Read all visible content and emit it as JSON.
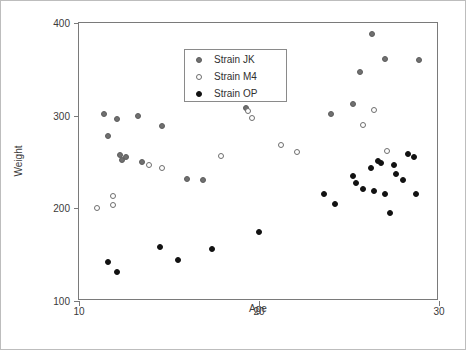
{
  "chart_data": {
    "type": "scatter",
    "title": "",
    "xlabel": "Age",
    "ylabel": "Weight",
    "xlim": [
      10,
      30
    ],
    "ylim": [
      100,
      400
    ],
    "xticks": [
      10,
      20,
      30
    ],
    "yticks": [
      100,
      200,
      300,
      400
    ],
    "grid": false,
    "legend_position": "top-left",
    "series": [
      {
        "name": "Strain JK",
        "marker": "filled-gray-circle",
        "color": "#707070",
        "points": [
          [
            11.4,
            302
          ],
          [
            11.6,
            278
          ],
          [
            12.1,
            296
          ],
          [
            12.3,
            258
          ],
          [
            12.4,
            252
          ],
          [
            12.6,
            255
          ],
          [
            13.3,
            300
          ],
          [
            13.5,
            250
          ],
          [
            14.6,
            289
          ],
          [
            16.0,
            232
          ],
          [
            16.9,
            231
          ],
          [
            19.0,
            321
          ],
          [
            19.3,
            308
          ],
          [
            19.6,
            322
          ],
          [
            24.0,
            302
          ],
          [
            25.2,
            313
          ],
          [
            25.6,
            347
          ],
          [
            26.3,
            388
          ],
          [
            27.0,
            361
          ],
          [
            28.9,
            360
          ]
        ]
      },
      {
        "name": "Strain M4",
        "marker": "open-circle",
        "color": "#ffffff",
        "points": [
          [
            11.0,
            200
          ],
          [
            11.9,
            213
          ],
          [
            11.9,
            204
          ],
          [
            13.9,
            247
          ],
          [
            14.6,
            243
          ],
          [
            17.9,
            256
          ],
          [
            19.4,
            305
          ],
          [
            19.6,
            298
          ],
          [
            21.2,
            268
          ],
          [
            22.1,
            261
          ],
          [
            25.8,
            290
          ],
          [
            26.4,
            306
          ],
          [
            27.1,
            262
          ]
        ]
      },
      {
        "name": "Strain OP",
        "marker": "filled-black-circle",
        "color": "#121212",
        "points": [
          [
            11.6,
            142
          ],
          [
            12.1,
            131
          ],
          [
            14.5,
            158
          ],
          [
            15.5,
            144
          ],
          [
            17.4,
            156
          ],
          [
            20.0,
            175
          ],
          [
            23.6,
            216
          ],
          [
            24.2,
            205
          ],
          [
            25.2,
            235
          ],
          [
            25.4,
            227
          ],
          [
            25.8,
            221
          ],
          [
            26.2,
            243
          ],
          [
            26.4,
            219
          ],
          [
            26.6,
            251
          ],
          [
            26.8,
            249
          ],
          [
            27.0,
            215
          ],
          [
            27.3,
            195
          ],
          [
            27.5,
            247
          ],
          [
            27.6,
            237
          ],
          [
            28.0,
            231
          ],
          [
            28.3,
            259
          ],
          [
            28.6,
            255
          ],
          [
            28.7,
            215
          ]
        ]
      }
    ]
  },
  "legend": {
    "entries": [
      {
        "label": "Strain JK",
        "marker_class": "jk"
      },
      {
        "label": "Strain M4",
        "marker_class": "m4"
      },
      {
        "label": "Strain OP",
        "marker_class": "op"
      }
    ]
  }
}
